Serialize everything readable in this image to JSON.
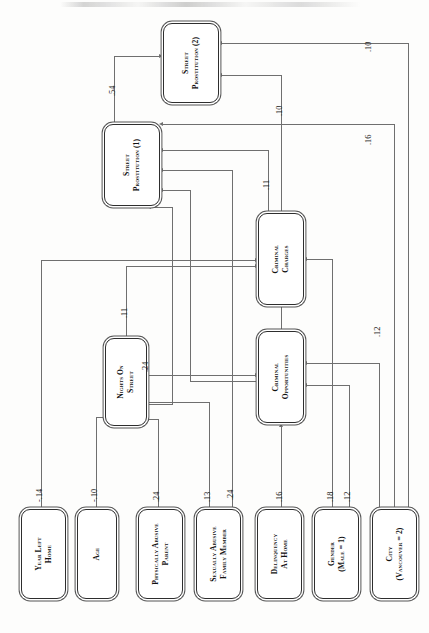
{
  "figure": {
    "type": "path-diagram",
    "orientation": "rotated-90-ccw"
  },
  "nodes": [
    {
      "id": "street_prostitution_2",
      "label": "Street Prostitution (2)",
      "role": "outcome"
    },
    {
      "id": "street_prostitution_1",
      "label": "Street Prostitution (1)",
      "role": "outcome"
    },
    {
      "id": "criminal_charges",
      "label": "Criminal Charges",
      "role": "mediator"
    },
    {
      "id": "criminal_opportunities",
      "label": "Criminal Opportunities",
      "role": "mediator"
    },
    {
      "id": "nights_on_street",
      "label": "Nights on Street",
      "role": "mediator"
    },
    {
      "id": "year_left_home",
      "label": "Year Left Home",
      "role": "exogenous"
    },
    {
      "id": "age",
      "label": "Age",
      "role": "exogenous"
    },
    {
      "id": "physically_abusive_parent",
      "label": "Physically Abusive Parent",
      "role": "exogenous"
    },
    {
      "id": "sexually_abusive_family_member",
      "label": "Sexually Abusive Family Member",
      "role": "exogenous"
    },
    {
      "id": "delinquency_at_home",
      "label": "Delinquency at Home",
      "role": "exogenous"
    },
    {
      "id": "gender",
      "label": "Gender (Male = 1)",
      "role": "exogenous"
    },
    {
      "id": "city",
      "label": "City (Vancouver = 2)",
      "role": "exogenous"
    }
  ],
  "edges": [
    {
      "from": "street_prostitution_1",
      "to": "street_prostitution_2",
      "coefficient": ".54"
    },
    {
      "from": "criminal_charges",
      "to": "street_prostitution_2",
      "coefficient": ".10"
    },
    {
      "from": "criminal_charges",
      "to": "street_prostitution_1",
      "coefficient": ".11"
    },
    {
      "from": "city",
      "to": "street_prostitution_2",
      "coefficient": ".10"
    },
    {
      "from": "city",
      "to": "street_prostitution_1",
      "coefficient": ".16"
    },
    {
      "from": "city",
      "to": "criminal_opportunities",
      "coefficient": ".12"
    },
    {
      "from": "nights_on_street",
      "to": "criminal_charges",
      "coefficient": ".11"
    },
    {
      "from": "nights_on_street",
      "to": "criminal_opportunities",
      "coefficient": ".24"
    },
    {
      "from": "year_left_home",
      "to": "criminal_charges",
      "coefficient": "-.14"
    },
    {
      "from": "age",
      "to": "nights_on_street",
      "coefficient": "-.10"
    },
    {
      "from": "physically_abusive_parent",
      "to": "nights_on_street",
      "coefficient": ".24"
    },
    {
      "from": "sexually_abusive_family_member",
      "to": "nights_on_street",
      "coefficient": ".13"
    },
    {
      "from": "sexually_abusive_family_member",
      "to": "street_prostitution_1",
      "coefficient": ".24"
    },
    {
      "from": "delinquency_at_home",
      "to": "criminal_opportunities",
      "coefficient": ".16"
    },
    {
      "from": "gender",
      "to": "criminal_charges",
      "coefficient": ".18"
    },
    {
      "from": "gender",
      "to": "criminal_opportunities",
      "coefficient": ".12"
    },
    {
      "from": "criminal_opportunities",
      "to": "criminal_charges",
      "coefficient": ""
    }
  ],
  "edge_labels": {
    "sp1_to_sp2": ".54",
    "cc_to_sp2": ".10",
    "city_to_sp2": ".10",
    "city_to_sp1": ".16",
    "cc_to_sp1": ".11",
    "nos_to_cc": ".11",
    "nos_to_co": ".24",
    "city_to_co": ".12",
    "year_left_home_out": "-.14",
    "age_out": "-.10",
    "physically_abusive_parent_out": ".24",
    "sexually_abusive_family_member_out_1": ".13",
    "sexually_abusive_family_member_out_2": ".24",
    "delinquency_at_home_out": ".16",
    "gender_out_1": ".18",
    "gender_out_2": ".12"
  },
  "node_labels": {
    "sp2_line1": "Street",
    "sp2_line2": "Prostitution (2)",
    "sp1_line1": "Street",
    "sp1_line2": "Prostitution (1)",
    "cc_line1": "Criminal",
    "cc_line2": "Charges",
    "co_line1": "Criminal",
    "co_line2": "Opportunities",
    "nos_line1": "Nights on",
    "nos_line2": "Street",
    "ylh_line1": "Year Left",
    "ylh_line2": "Home",
    "age_line1": "Age",
    "pap_line1": "Physically Abusive",
    "pap_line2": "Parent",
    "safm_line1": "Sexually Abusive",
    "safm_line2": "Family Member",
    "dah_line1": "Delinquency",
    "dah_line2": "at Home",
    "gender_line1": "Gender",
    "gender_line2": "(Male = 1)",
    "city_line1": "City",
    "city_line2": "(Vancouver = 2)"
  },
  "colors": {
    "line": "#6f6f6f",
    "node_border": "#2e2e2e",
    "node_outer": "#555555",
    "text": "#111111",
    "background": "#fdfdfc"
  }
}
